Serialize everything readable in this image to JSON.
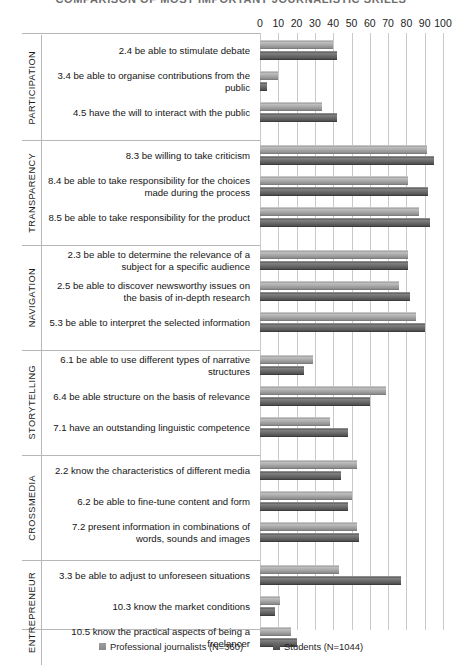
{
  "chart_title": "COMPARISON OF MOST IMPORTANT JOURNALISTIC SKILLS",
  "axis": {
    "ticks": [
      "0",
      "10",
      "20",
      "30",
      "40",
      "50",
      "60",
      "70",
      "80",
      "90",
      "100"
    ],
    "min": 0,
    "max": 100,
    "step": 10
  },
  "legend": {
    "items": [
      {
        "label": "Professional journalists (N=360)",
        "swatch": "prof",
        "color": "#a9a9a9"
      },
      {
        "label": "Students (N=1044)",
        "swatch": "stud",
        "color": "#5d5d5d"
      }
    ]
  },
  "sections": [
    {
      "name": "PARTICIPATION",
      "rows": [
        {
          "label": "2.4 be able to stimulate debate",
          "prof": 40,
          "stud": 42
        },
        {
          "label": "3.4 be able to organise contributions from the public",
          "prof": 10,
          "stud": 4
        },
        {
          "label": "4.5 have the will to interact with the public",
          "prof": 34,
          "stud": 42
        }
      ]
    },
    {
      "name": "TRANSPARENCY",
      "rows": [
        {
          "label": "8.3 be willing to take criticism",
          "prof": 91,
          "stud": 95
        },
        {
          "label": "8.4 be able to take responsibility for the choices made during the process",
          "prof": 81,
          "stud": 92
        },
        {
          "label": "8.5 be able to take responsibility for the product",
          "prof": 87,
          "stud": 93
        }
      ]
    },
    {
      "name": "NAVIGATION",
      "rows": [
        {
          "label": "2.3 be able to determine the relevance of a subject for a specific audience",
          "prof": 81,
          "stud": 81
        },
        {
          "label": "2.5 be able to discover newsworthy issues on the basis of in-depth research",
          "prof": 76,
          "stud": 82
        },
        {
          "label": "5.3 be able to interpret the selected information",
          "prof": 85,
          "stud": 90
        }
      ]
    },
    {
      "name": "STORYTELLING",
      "rows": [
        {
          "label": "6.1 be able to use different types of narrative structures",
          "prof": 29,
          "stud": 24
        },
        {
          "label": "6.4 be able structure on the basis of relevance",
          "prof": 69,
          "stud": 60
        },
        {
          "label": "7.1 have an outstanding linguistic competence",
          "prof": 38,
          "stud": 48
        }
      ]
    },
    {
      "name": "CROSSMEDIA",
      "rows": [
        {
          "label": "2.2 know the characteristics of different media",
          "prof": 53,
          "stud": 44
        },
        {
          "label": "6.2 be able to fine-tune content and form",
          "prof": 50,
          "stud": 48
        },
        {
          "label": "7.2 present information in combinations of words, sounds and images",
          "prof": 53,
          "stud": 54
        }
      ]
    },
    {
      "name": "ENTREPRENEUR",
      "rows": [
        {
          "label": "3.3 be able to adjust to unforeseen situations",
          "prof": 43,
          "stud": 77
        },
        {
          "label": "10.3 know the market conditions",
          "prof": 11,
          "stud": 8
        },
        {
          "label": "10.5 know the practical aspects of being a freelancer",
          "prof": 17,
          "stud": 20
        }
      ]
    }
  ],
  "chart_data": {
    "type": "bar",
    "title": "COMPARISON OF MOST IMPORTANT JOURNALISTIC SKILLS",
    "orientation": "horizontal",
    "xlabel": "",
    "ylabel": "",
    "xlim": [
      0,
      100
    ],
    "xticks": [
      0,
      10,
      20,
      30,
      40,
      50,
      60,
      70,
      80,
      90,
      100
    ],
    "grid": true,
    "legend_position": "bottom",
    "groups": [
      "PARTICIPATION",
      "TRANSPARENCY",
      "NAVIGATION",
      "STORYTELLING",
      "CROSSMEDIA",
      "ENTREPRENEUR"
    ],
    "categories": [
      "2.4 be able to stimulate debate",
      "3.4 be able to organise contributions from the public",
      "4.5 have the will to interact with the public",
      "8.3 be willing to take criticism",
      "8.4 be able to take responsibility for the choices made during the process",
      "8.5 be able to take responsibility for the product",
      "2.3 be able to determine the relevance of a subject for a specific audience",
      "2.5 be able to discover newsworthy issues on the basis of in-depth research",
      "5.3 be able to interpret the selected information",
      "6.1 be able to use different types of narrative structures",
      "6.4 be able structure on the basis of relevance",
      "7.1 have an outstanding linguistic competence",
      "2.2 know the characteristics of different media",
      "6.2 be able to fine-tune content and form",
      "7.2 present information in combinations of words, sounds and images",
      "3.3 be able to adjust to unforeseen situations",
      "10.3 know the market conditions",
      "10.5 know the practical aspects of being a freelancer"
    ],
    "series": [
      {
        "name": "Professional journalists (N=360)",
        "color": "#a9a9a9",
        "values": [
          40,
          10,
          34,
          91,
          81,
          87,
          81,
          76,
          85,
          29,
          69,
          38,
          53,
          50,
          53,
          43,
          11,
          17
        ]
      },
      {
        "name": "Students (N=1044)",
        "color": "#5d5d5d",
        "values": [
          42,
          4,
          42,
          95,
          92,
          93,
          81,
          82,
          90,
          24,
          60,
          48,
          44,
          48,
          54,
          77,
          8,
          20
        ]
      }
    ]
  }
}
